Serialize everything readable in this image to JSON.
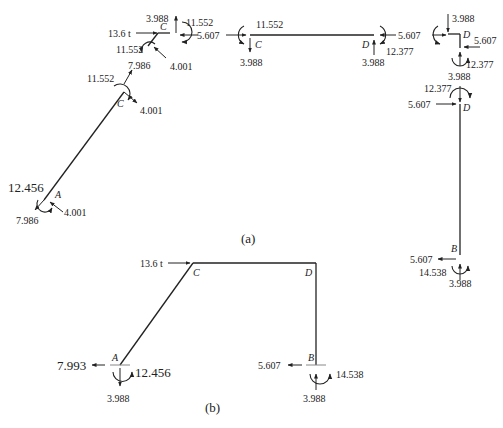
{
  "figure": {
    "caption_a": "(a)",
    "caption_b": "(b)"
  },
  "part_a": {
    "joint_C_top": {
      "node": "C",
      "applied_load": "13.6 t",
      "vertical_up": "3.988",
      "moment_right": "11.552",
      "horizontal_right": "5.607",
      "moment_left": "11.552",
      "diag_down": "7.986",
      "diag_force": "4.001"
    },
    "member_CA_top": {
      "node": "C",
      "moment": "11.552",
      "axial": "7.986",
      "shear": "4.001"
    },
    "member_CA_bottom": {
      "node": "A",
      "moment": "12.456",
      "axial": "7.986",
      "shear": "4.001"
    },
    "member_CD": {
      "node_left": "C",
      "node_right": "D",
      "left_horizontal": "5.607",
      "left_moment": "11.552",
      "left_vertical": "3.988",
      "right_vertical": "3.988",
      "right_moment": "12.377",
      "right_horizontal": "5.607"
    },
    "joint_D": {
      "node": "D",
      "vertical_down": "3.988",
      "horizontal_left": "5.607",
      "horizontal_right": "5.607",
      "moment": "12.377",
      "vertical_bottom": "3.988"
    },
    "member_DB": {
      "node_top": "D",
      "node_bottom": "B",
      "top_moment": "12.377",
      "top_horizontal": "5.607",
      "bottom_horizontal": "5.607",
      "bottom_moment": "14.538",
      "bottom_vertical": "3.988"
    }
  },
  "part_b": {
    "applied_load": "13.6 t",
    "nodes": {
      "A": "A",
      "B": "B",
      "C": "C",
      "D": "D"
    },
    "support_A": {
      "horizontal": "7.993",
      "moment": "12.456",
      "vertical": "3.988"
    },
    "support_B": {
      "horizontal": "5.607",
      "moment": "14.538",
      "vertical": "3.988"
    }
  }
}
